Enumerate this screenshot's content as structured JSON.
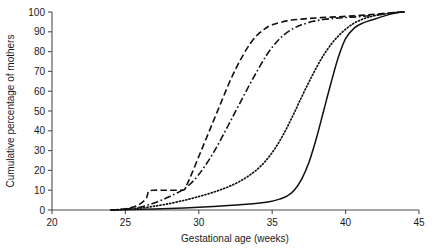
{
  "chart_data": {
    "type": "line",
    "title": "",
    "xlabel": "Gestational age (weeks)",
    "ylabel": "Cumulative percentage of mothers",
    "xlim": [
      20,
      45
    ],
    "ylim": [
      0,
      100
    ],
    "xticks": [
      20,
      25,
      30,
      35,
      40,
      45
    ],
    "yticks": [
      0,
      10,
      20,
      30,
      40,
      50,
      60,
      70,
      80,
      90,
      100
    ],
    "grid": false,
    "legend": "none",
    "line_color": "#111111",
    "axis_color": "#4d4d4d",
    "series": [
      {
        "name": "curve-1-long-dash",
        "style": "dashed",
        "x": [
          24.0,
          24.6,
          25.0,
          25.4,
          25.8,
          26.1,
          26.4,
          26.5,
          26.6,
          27.0,
          27.4,
          28.0,
          28.6,
          29.0,
          29.2,
          29.5,
          30.0,
          30.5,
          31.0,
          31.5,
          32.0,
          32.5,
          33.0,
          33.5,
          34.0,
          34.5,
          35.0,
          36.0,
          37.0,
          38.0,
          39.0,
          40.0,
          41.0,
          42.0,
          43.0,
          43.6,
          44.0
        ],
        "y": [
          0.0,
          0.3,
          0.6,
          1.2,
          2.2,
          3.6,
          5.6,
          7.5,
          9.6,
          10.0,
          10.0,
          10.0,
          10.0,
          10.2,
          13.0,
          18.0,
          27.0,
          36.0,
          45.0,
          54.0,
          63.0,
          71.0,
          78.0,
          84.0,
          88.5,
          91.5,
          93.5,
          95.5,
          96.4,
          97.0,
          97.4,
          97.8,
          98.3,
          98.9,
          99.5,
          99.9,
          100.0
        ]
      },
      {
        "name": "curve-2-dash-dot",
        "style": "dashdot",
        "x": [
          24.0,
          24.8,
          25.4,
          25.9,
          26.4,
          26.9,
          27.4,
          27.9,
          28.4,
          28.9,
          29.4,
          29.9,
          30.4,
          31.0,
          31.6,
          32.2,
          32.8,
          33.4,
          34.0,
          34.6,
          35.2,
          35.8,
          36.4,
          37.0,
          37.8,
          38.6,
          39.4,
          40.2,
          41.0,
          42.0,
          43.0,
          43.6,
          44.0
        ],
        "y": [
          0.0,
          0.3,
          0.7,
          1.3,
          2.2,
          3.4,
          4.8,
          6.4,
          8.2,
          10.2,
          13.0,
          17.0,
          22.0,
          29.0,
          37.0,
          45.5,
          54.0,
          62.5,
          70.5,
          78.0,
          84.0,
          88.5,
          91.5,
          93.5,
          95.3,
          96.3,
          96.9,
          97.3,
          97.7,
          98.4,
          99.3,
          99.8,
          100.0
        ]
      },
      {
        "name": "curve-3-dotted",
        "style": "dotted",
        "x": [
          24.0,
          25.0,
          25.8,
          26.5,
          27.2,
          27.9,
          28.6,
          29.3,
          30.0,
          30.7,
          31.4,
          32.1,
          32.8,
          33.5,
          34.2,
          34.9,
          35.6,
          36.3,
          37.0,
          37.7,
          38.4,
          39.1,
          39.8,
          40.5,
          41.2,
          42.0,
          43.0,
          43.6,
          44.0
        ],
        "y": [
          0.0,
          0.3,
          0.8,
          1.4,
          2.2,
          3.1,
          4.2,
          5.4,
          6.8,
          8.3,
          10.0,
          12.0,
          14.5,
          17.8,
          22.0,
          28.0,
          36.0,
          46.0,
          57.0,
          67.5,
          77.0,
          84.5,
          90.0,
          94.0,
          96.5,
          98.2,
          99.4,
          99.9,
          100.0
        ]
      },
      {
        "name": "curve-4-solid",
        "style": "solid",
        "x": [
          24.0,
          25.5,
          27.0,
          28.5,
          30.0,
          31.0,
          32.0,
          33.0,
          34.0,
          34.8,
          35.5,
          36.0,
          36.5,
          37.0,
          37.5,
          38.0,
          38.5,
          39.0,
          39.5,
          40.0,
          40.6,
          41.2,
          42.0,
          43.0,
          43.6,
          44.0
        ],
        "y": [
          0.0,
          0.2,
          0.5,
          0.9,
          1.4,
          1.8,
          2.3,
          2.8,
          3.4,
          4.2,
          5.5,
          7.0,
          10.0,
          15.5,
          24.0,
          36.0,
          50.0,
          64.0,
          77.0,
          86.5,
          92.0,
          94.5,
          96.5,
          98.8,
          99.8,
          100.0
        ]
      }
    ]
  },
  "axes": {
    "x_tick_labels": [
      "20",
      "25",
      "30",
      "35",
      "40",
      "45"
    ],
    "y_tick_labels": [
      "0",
      "10",
      "20",
      "30",
      "40",
      "50",
      "60",
      "70",
      "80",
      "90",
      "100"
    ]
  }
}
